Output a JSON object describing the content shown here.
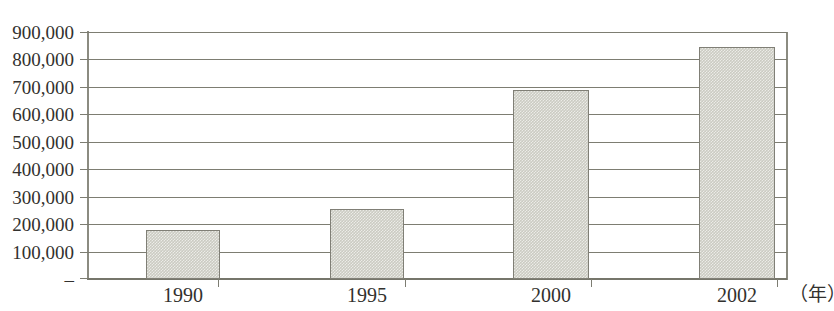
{
  "chart_data": {
    "type": "bar",
    "title": "",
    "xlabel": "（年）",
    "ylabel": "",
    "categories": [
      "1990",
      "1995",
      "2000",
      "2002"
    ],
    "values": [
      180000,
      255000,
      690000,
      845000
    ],
    "ylim": [
      0,
      900000
    ],
    "ytick_values": [
      0,
      100000,
      200000,
      300000,
      400000,
      500000,
      600000,
      700000,
      800000,
      900000
    ],
    "ytick_labels": [
      "–",
      "100,000",
      "200,000",
      "300,000",
      "400,000",
      "500,000",
      "600,000",
      "700,000",
      "800,000",
      "900,000"
    ],
    "grid": true,
    "legend": null,
    "series": [
      {
        "name": "",
        "values": [
          180000,
          255000,
          690000,
          845000
        ]
      }
    ],
    "colors": {
      "bar_fill": "#cbcbc2",
      "bar_border": "#807f76",
      "gridline": "#7d7d72",
      "axis": "#8b8b81",
      "text": "#32312e",
      "background": "#ffffff"
    }
  }
}
